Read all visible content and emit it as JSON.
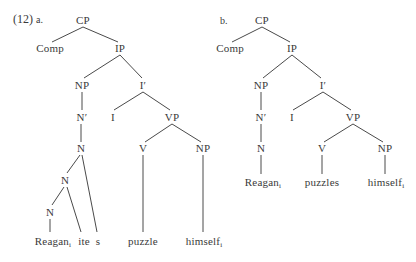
{
  "example": {
    "number": "(12)",
    "a_label": "a.",
    "b_label": "b."
  },
  "tree_a": {
    "nodes": {
      "cp": "CP",
      "comp": "Comp",
      "ip": "IP",
      "np": "NP",
      "ibar": "I′",
      "nbar": "N′",
      "i": "I",
      "vp": "VP",
      "n1": "N",
      "n2": "N",
      "n3": "N",
      "v": "V",
      "np2": "NP"
    },
    "leaves": {
      "reagan": "Reagan",
      "reagan_index": "i",
      "ite": "ite",
      "s": "s",
      "puzzle": "puzzle",
      "himself": "himself",
      "himself_index": "i"
    }
  },
  "tree_b": {
    "nodes": {
      "cp": "CP",
      "comp": "Comp",
      "ip": "IP",
      "np": "NP",
      "ibar": "I′",
      "nbar": "N′",
      "i": "I",
      "vp": "VP",
      "n": "N",
      "v": "V",
      "np2": "NP"
    },
    "leaves": {
      "reagan": "Reagan",
      "reagan_index": "i",
      "puzzles": "puzzles",
      "himself": "himself",
      "himself_index": "i"
    }
  }
}
